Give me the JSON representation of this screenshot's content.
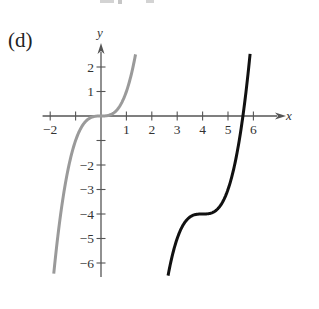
{
  "panel_label": "(d)",
  "chart_data": {
    "type": "line",
    "title": "(d)",
    "xlabel": "x",
    "ylabel": "y",
    "xlim": [
      -2.3,
      7.0
    ],
    "ylim": [
      -6.5,
      2.9
    ],
    "grid": false,
    "legend": null,
    "x_ticks": [
      -2,
      -1,
      1,
      2,
      3,
      4,
      5,
      6
    ],
    "x_tick_labels": [
      "−2",
      "",
      "1",
      "2",
      "3",
      "4",
      "5",
      "6"
    ],
    "y_ticks": [
      -6,
      -5,
      -4,
      -3,
      -2,
      -1,
      1,
      2
    ],
    "y_tick_labels": [
      "−6",
      "−5",
      "−4",
      "−3",
      "−2",
      "",
      "1",
      "2"
    ],
    "series": [
      {
        "name": "y = x^3",
        "color": "#9a9a9a",
        "expression": "x^3",
        "x_range": [
          -1.86,
          1.36
        ],
        "points": [
          [
            -1.86,
            -6.43
          ],
          [
            -1.5,
            -3.38
          ],
          [
            -1.0,
            -1.0
          ],
          [
            -0.5,
            -0.13
          ],
          [
            0,
            0
          ],
          [
            0.5,
            0.13
          ],
          [
            1.0,
            1.0
          ],
          [
            1.36,
            2.52
          ]
        ]
      },
      {
        "name": "y = (x-4)^3 - 4",
        "color": "#111111",
        "expression": "(x-4)^3 - 4",
        "x_range": [
          2.64,
          5.87
        ],
        "points": [
          [
            2.64,
            -6.52
          ],
          [
            3.0,
            -5.0
          ],
          [
            3.5,
            -4.13
          ],
          [
            4.0,
            -4.0
          ],
          [
            4.5,
            -3.88
          ],
          [
            5.0,
            -3.0
          ],
          [
            5.59,
            0.02
          ],
          [
            5.87,
            2.54
          ]
        ]
      }
    ]
  },
  "layout": {
    "origin_px": [
      101,
      116
    ],
    "px_per_unit_x": 25.4,
    "px_per_unit_y": 24.5
  }
}
